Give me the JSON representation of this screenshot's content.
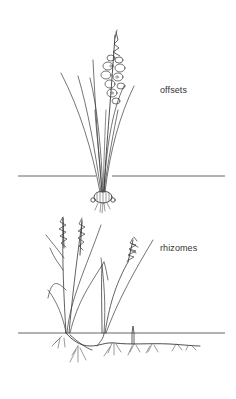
{
  "figure": {
    "panels": [
      {
        "id": "offsets",
        "label": "offsets",
        "subject": "flowering plant with corm producing offsets",
        "ground_line_y": 176
      },
      {
        "id": "rhizomes",
        "label": "rhizomes",
        "subject": "grass spreading by underground rhizomes",
        "ground_line_y": 333
      }
    ]
  },
  "colors": {
    "background": "#ffffff",
    "ink": "#3a3a3a",
    "label_text": "#333333"
  }
}
